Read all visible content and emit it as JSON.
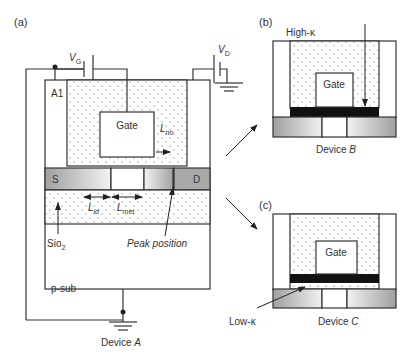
{
  "figure": {
    "panels": {
      "a": {
        "label": "(a)",
        "device_caption_prefix": "Device ",
        "device_caption_letter": "A"
      },
      "b": {
        "label": "(b)",
        "device_caption_prefix": "Device ",
        "device_caption_letter": "B",
        "annotation": "High-κ"
      },
      "c": {
        "label": "(c)",
        "device_caption_prefix": "Device ",
        "device_caption_letter": "C",
        "annotation": "Low-κ"
      }
    },
    "labels": {
      "vg_main": "V",
      "vg_sub": "G",
      "vd_main": "V",
      "vd_sub": "D",
      "a1": "A1",
      "gate": "Gate",
      "lno_main": "L",
      "lno_sub": "no",
      "source": "S",
      "drain": "D",
      "lld_main": "L",
      "lld_sub": "ld",
      "lmet_main": "L",
      "lmet_sub": "met",
      "sio2_main": "Sio",
      "sio2_sub": "2",
      "peak_position": "Peak position",
      "psub": "p-sub"
    },
    "colors": {
      "stroke": "#333333",
      "sd_gradient_dark": "#9a9a9a",
      "sd_gradient_light": "#f0f0f0",
      "dielectric_dots": "#555555",
      "gate_dielectric_fill": "#111111"
    }
  }
}
